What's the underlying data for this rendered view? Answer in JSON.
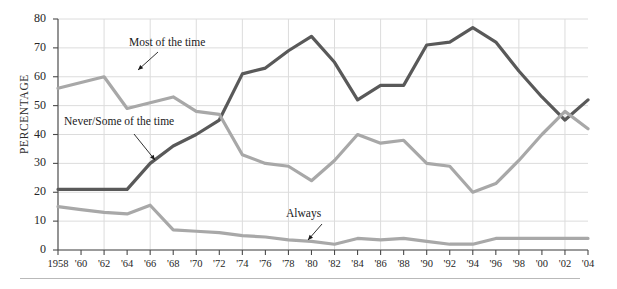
{
  "chart_data": {
    "type": "line",
    "title": "",
    "xlabel": "",
    "ylabel": "PERCENTAGE",
    "ylim": [
      0,
      80
    ],
    "yticks": [
      0,
      10,
      20,
      30,
      40,
      50,
      60,
      70,
      80
    ],
    "ytick_labels": [
      "0",
      "10",
      "20",
      "30",
      "40",
      "50",
      "60",
      "70",
      "80"
    ],
    "grid": true,
    "legend_position": "inline-annotations",
    "x": [
      1958,
      1960,
      1962,
      1964,
      1966,
      1968,
      1970,
      1972,
      1974,
      1976,
      1978,
      1980,
      1982,
      1984,
      1986,
      1988,
      1990,
      1992,
      1994,
      1996,
      1998,
      2000,
      2002,
      2004
    ],
    "xtick_labels": [
      "1958",
      "'60",
      "'62",
      "'64",
      "'66",
      "'68",
      "'70",
      "'72",
      "'74",
      "'76",
      "'78",
      "'80",
      "'82",
      "'84",
      "'86",
      "'88",
      "'90",
      "'92",
      "'94",
      "'96",
      "'98",
      "'00",
      "'02",
      "'04"
    ],
    "series": [
      {
        "name": "Never/Some of the time",
        "color": "#595959",
        "values": [
          21,
          21,
          21,
          21,
          30,
          36,
          40,
          45,
          61,
          63,
          69,
          74,
          65,
          52,
          57,
          57,
          71,
          72,
          77,
          72,
          62,
          53,
          45,
          52
        ]
      },
      {
        "name": "Most of the time",
        "color": "#a8a8a8",
        "values": [
          56,
          58,
          60,
          49,
          51,
          53,
          48,
          47,
          33,
          30,
          29,
          24,
          31,
          40,
          37,
          38,
          30,
          29,
          20,
          23,
          31,
          40,
          48,
          42
        ]
      },
      {
        "name": "Always",
        "color": "#a8a8a8",
        "values": [
          15,
          14,
          13,
          12.5,
          15.5,
          7,
          6.5,
          6,
          5,
          4.5,
          3.5,
          3,
          2,
          4,
          3.5,
          4,
          3,
          2,
          2,
          4,
          4,
          4,
          4,
          4
        ]
      }
    ],
    "annotations": [
      {
        "text": "Most of the time",
        "series": "Most of the time"
      },
      {
        "text": "Never/Some of the time",
        "series": "Never/Some of the time"
      },
      {
        "text": "Always",
        "series": "Always"
      }
    ]
  }
}
